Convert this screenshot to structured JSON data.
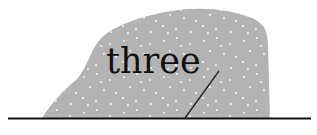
{
  "figure": {
    "label": "three",
    "colors": {
      "background": "#ffffff",
      "shape_fill": "#b3b3b3",
      "speckle": "#f2f2f2",
      "text": "#111111",
      "ground_line": "#111111",
      "crack_line": "#222222"
    }
  }
}
